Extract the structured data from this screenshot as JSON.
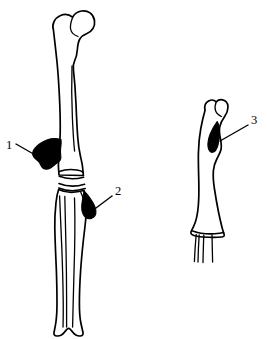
{
  "figure": {
    "background_color": "#ffffff",
    "line_color": "#000000",
    "lesion_color": "#000000",
    "width": 267,
    "height": 339
  },
  "labels": [
    {
      "id": "label-1",
      "text": "1",
      "x": 9,
      "y": 146,
      "leader_from": [
        16,
        144
      ],
      "leader_to": [
        37,
        156
      ],
      "points_to": "lesion-femur-medial-distal"
    },
    {
      "id": "label-2",
      "text": "2",
      "x": 118,
      "y": 192,
      "leader_from": [
        112,
        196
      ],
      "leader_to": [
        96,
        208
      ],
      "points_to": "lesion-tibia-proximal-lateral"
    },
    {
      "id": "label-3",
      "text": "3",
      "x": 254,
      "y": 121,
      "leader_from": [
        248,
        125
      ],
      "leader_to": [
        220,
        141
      ],
      "points_to": "lesion-humerus-proximal"
    }
  ],
  "bones": [
    {
      "id": "bone-femur",
      "name": "femur",
      "side": "left",
      "description": "Proximal femur with head, neck, greater trochanter and shaft descending to distal condyles"
    },
    {
      "id": "bone-tibia-fibula",
      "name": "tibia-fibula",
      "side": "left",
      "description": "Tibia and fibula below the knee joint, fused distally"
    },
    {
      "id": "bone-humerus",
      "name": "humerus",
      "side": "right",
      "description": "Humerus with proximal head and distal end showing three fine linear extensions"
    }
  ],
  "lesions": [
    {
      "id": "lesion-femur-medial-distal",
      "label": "1",
      "description": "Large irregular filled lesion on the medial distal femur"
    },
    {
      "id": "lesion-tibia-proximal-lateral",
      "label": "2",
      "description": "Teardrop-shaped filled lesion on the lateral proximal tibia"
    },
    {
      "id": "lesion-humerus-proximal",
      "label": "3",
      "description": "Narrow spindle-shaped filled lesion on the proximal humeral shaft"
    }
  ]
}
